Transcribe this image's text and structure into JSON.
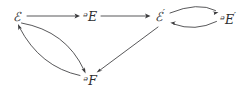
{
  "figure": {
    "kind": "commutative-diagram",
    "background_color": "#ffffff",
    "line_color": "#3a3a3c",
    "label_color": "#2e2e30"
  },
  "nodes": [
    {
      "id": "E",
      "label": "ℰ",
      "prime": "",
      "x": 17,
      "y": 16
    },
    {
      "id": "S",
      "label": "ᵊE",
      "prime": "",
      "x": 90,
      "y": 16
    },
    {
      "id": "Eprime",
      "label": "ℰ",
      "prime": "′",
      "x": 160,
      "y": 16
    },
    {
      "id": "Sprime",
      "label": "ᵊE",
      "prime": "′",
      "x": 228,
      "y": 19
    },
    {
      "id": "T",
      "label": "ᵊF",
      "prime": "",
      "x": 90,
      "y": 80
    }
  ],
  "edges": [
    {
      "id": "e-to-s",
      "from": "E",
      "to": "S",
      "style": "straight"
    },
    {
      "id": "s-to-eprime",
      "from": "S",
      "to": "Eprime",
      "style": "straight"
    },
    {
      "id": "eprime-to-sprime",
      "from": "Eprime",
      "to": "Sprime",
      "style": "curved-upper"
    },
    {
      "id": "sprime-to-eprime",
      "from": "Sprime",
      "to": "Eprime",
      "style": "curved-lower"
    },
    {
      "id": "e-to-t",
      "from": "E",
      "to": "T",
      "style": "curved-upper"
    },
    {
      "id": "t-to-e",
      "from": "T",
      "to": "E",
      "style": "curved-lower"
    },
    {
      "id": "eprime-to-t",
      "from": "Eprime",
      "to": "T",
      "style": "straight"
    }
  ]
}
